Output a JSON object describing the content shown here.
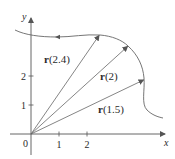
{
  "figure": {
    "type": "vector-valued function diagram",
    "axes": {
      "x_label": "x",
      "y_label": "y",
      "origin_label": "0",
      "x_ticks": [
        "1",
        "2"
      ],
      "y_ticks": [
        "1",
        "2"
      ]
    },
    "vectors": [
      {
        "bold": "r",
        "arg": "(2.4)"
      },
      {
        "bold": "r",
        "arg": "(2)"
      },
      {
        "bold": "r",
        "arg": "(1.5)"
      }
    ],
    "colors": {
      "line": "#555555",
      "curve": "#666666",
      "text": "#2a2a2a"
    }
  }
}
